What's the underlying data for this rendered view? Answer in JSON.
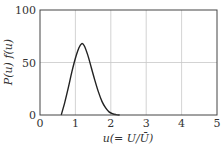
{
  "chart_data": {
    "type": "line",
    "title": "",
    "xlabel": "u(= U/Ū)",
    "ylabel": "P(u) f(u)",
    "xlim": [
      0,
      5
    ],
    "ylim": [
      0,
      100
    ],
    "xticks": [
      "0",
      "1",
      "2",
      "3",
      "4",
      "5"
    ],
    "yticks": [
      "0",
      "50",
      "100"
    ],
    "grid": true,
    "legend": null,
    "series": [
      {
        "name": "P(u) f(u)",
        "x": [
          0.6,
          0.7,
          0.8,
          0.9,
          1.0,
          1.1,
          1.18,
          1.25,
          1.35,
          1.45,
          1.55,
          1.65,
          1.75,
          1.85,
          1.95,
          2.05,
          2.15,
          2.25
        ],
        "y": [
          0,
          12,
          26,
          41,
          54,
          64,
          68,
          66,
          57,
          45,
          33,
          22,
          13,
          7,
          3,
          1.2,
          0.4,
          0
        ]
      }
    ]
  },
  "axes": {
    "x_label_main": "u",
    "x_label_paren": "(= U/Ū)",
    "y_label": "P(u) f(u)",
    "x_ticks": [
      "0",
      "1",
      "2",
      "3",
      "4",
      "5"
    ],
    "y_ticks": [
      "0",
      "50",
      "100"
    ]
  },
  "colors": {
    "curve": "#222222",
    "grid": "#c8c8c8",
    "frame": "#444444"
  }
}
